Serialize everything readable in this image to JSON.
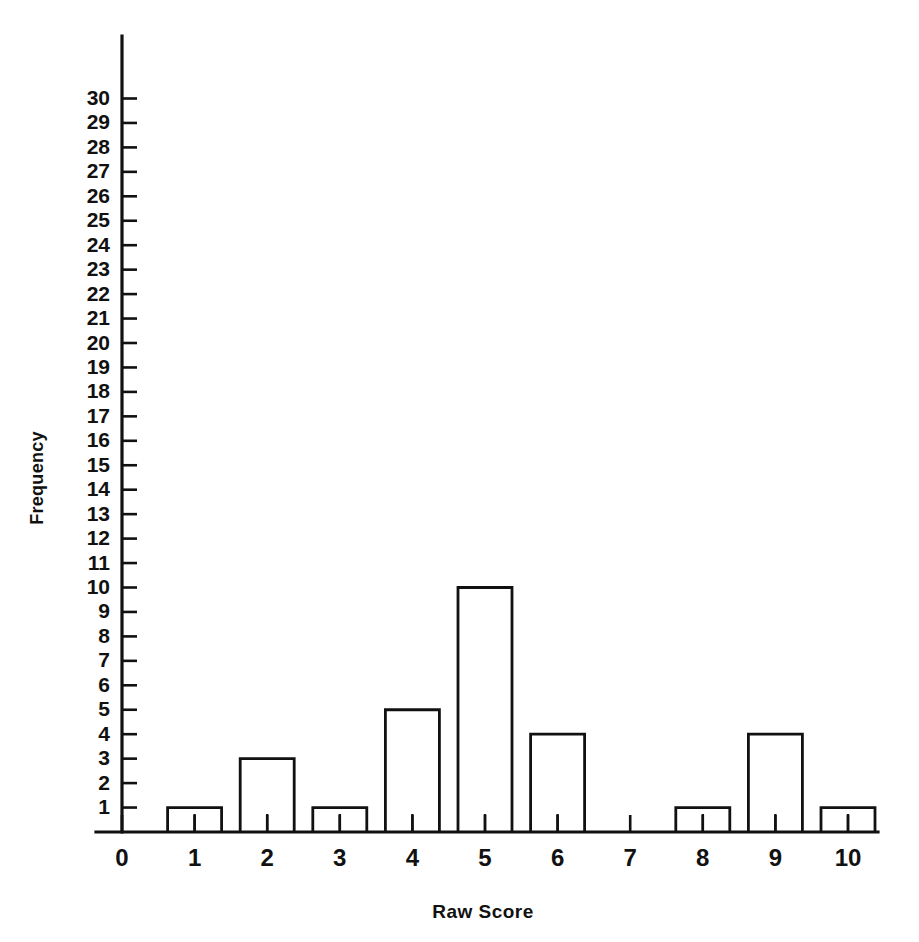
{
  "chart_data": {
    "type": "bar",
    "title": "",
    "subtitle": "",
    "xlabel": "Raw Score",
    "ylabel": "Frequency",
    "categories": [
      "1",
      "2",
      "3",
      "4",
      "5",
      "6",
      "7",
      "8",
      "9",
      "10"
    ],
    "values": [
      1,
      3,
      1,
      5,
      10,
      4,
      0,
      1,
      4,
      1
    ],
    "series": [
      {
        "name": "Frequency",
        "values": [
          1,
          3,
          1,
          5,
          10,
          4,
          0,
          1,
          4,
          1
        ]
      }
    ],
    "x_tick_labels": [
      "0",
      "1",
      "2",
      "3",
      "4",
      "5",
      "6",
      "7",
      "8",
      "9",
      "10"
    ],
    "y_tick_labels": [
      "1",
      "2",
      "3",
      "4",
      "5",
      "6",
      "7",
      "8",
      "9",
      "10",
      "11",
      "12",
      "13",
      "14",
      "15",
      "16",
      "17",
      "18",
      "19",
      "20",
      "21",
      "22",
      "23",
      "24",
      "25",
      "26",
      "27",
      "28",
      "29",
      "30"
    ],
    "xlim": [
      0,
      10
    ],
    "ylim": [
      0,
      30
    ],
    "grid": false,
    "legend": "none",
    "bar_style": "outlined",
    "bar_fill": "#ffffff",
    "bar_stroke": "#111111",
    "background": "#ffffff",
    "annotations": []
  }
}
